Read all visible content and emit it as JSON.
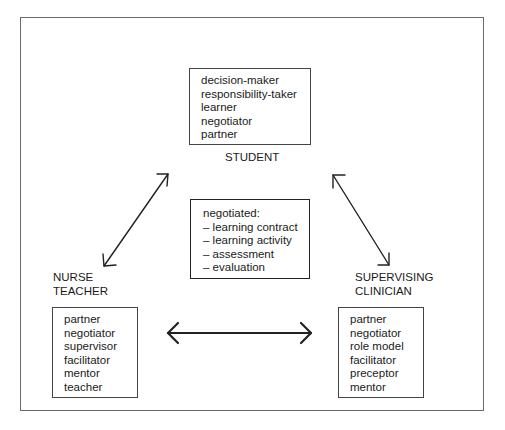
{
  "diagram": {
    "student": {
      "label": "STUDENT",
      "roles": [
        "decision-maker",
        "responsibility-taker",
        "learner",
        "negotiator",
        "partner"
      ]
    },
    "negotiated": {
      "heading": "negotiated:",
      "items": [
        "–  learning contract",
        "–  learning activity",
        "–  assessment",
        "–  evaluation"
      ]
    },
    "nurse_teacher": {
      "label_lines": [
        "NURSE",
        "TEACHER"
      ],
      "roles": [
        "partner",
        "negotiator",
        "supervisor",
        "facilitator",
        "mentor",
        "teacher"
      ]
    },
    "supervising_clinician": {
      "label_lines": [
        "SUPERVISING",
        "CLINICIAN"
      ],
      "roles": [
        "partner",
        "negotiator",
        "role model",
        "facilitator",
        "preceptor",
        "mentor"
      ]
    },
    "connections": [
      {
        "from": "nurse_teacher",
        "to": "student",
        "type": "bidirectional"
      },
      {
        "from": "student",
        "to": "supervising_clinician",
        "type": "bidirectional"
      },
      {
        "from": "nurse_teacher",
        "to": "supervising_clinician",
        "type": "bidirectional"
      }
    ],
    "colors": {
      "line": "#222222",
      "frame": "#6a6a6a",
      "background": "#ffffff"
    }
  }
}
